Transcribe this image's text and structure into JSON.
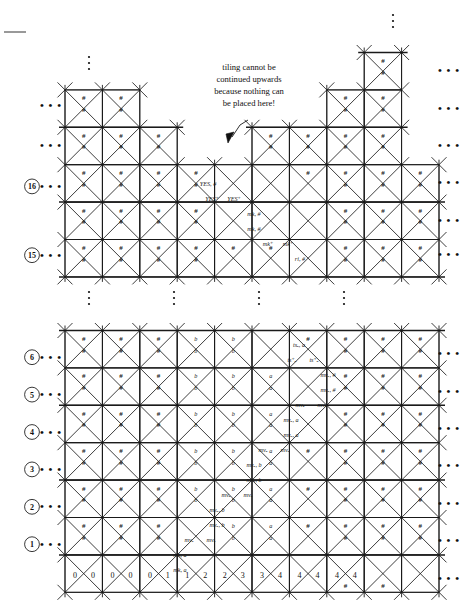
{
  "figure": {
    "annotation": {
      "lines": [
        "tiling cannot be",
        "continued upwards",
        "because nothing can",
        "be placed here!"
      ]
    },
    "ellipsis": "• • •",
    "vertical_dots": "⋮",
    "hash": "#"
  },
  "upper_grid": {
    "row_numbers": [
      "16",
      "15"
    ],
    "labels": [
      {
        "text": "YES, #",
        "x": 208,
        "y": 186
      },
      {
        "text": "YES⁺",
        "x": 212,
        "y": 201
      },
      {
        "text": "YES⁺",
        "x": 234,
        "y": 201
      },
      {
        "text": "mk, #",
        "x": 254,
        "y": 216
      },
      {
        "text": "mk, #",
        "x": 254,
        "y": 231
      },
      {
        "text": "mk⁺",
        "x": 268,
        "y": 246
      },
      {
        "text": "mk⁺",
        "x": 288,
        "y": 246
      },
      {
        "text": "ri, #",
        "x": 300,
        "y": 261
      }
    ]
  },
  "lower_grid": {
    "row_numbers": [
      "6",
      "5",
      "4",
      "3",
      "2",
      "1"
    ],
    "bottom_digits": [
      "0",
      "0",
      "0",
      "0",
      "0",
      "1",
      "1",
      "2",
      "2",
      "3",
      "3",
      "4",
      "4",
      "4",
      "4",
      "4"
    ],
    "letter_cells": {
      "a": "a",
      "b": "b"
    },
    "labels": [
      {
        "text": "tsₐ, a",
        "x": 299,
        "y": 347
      },
      {
        "text": "ts⁺ₐ",
        "x": 292,
        "y": 362
      },
      {
        "text": "ts⁺ₐ",
        "x": 314,
        "y": 362
      },
      {
        "text": "mvₐ, #",
        "x": 328,
        "y": 377
      },
      {
        "text": "mvₐ, #",
        "x": 328,
        "y": 392
      },
      {
        "text": "mvₐ",
        "x": 300,
        "y": 407
      },
      {
        "text": "mvₐ",
        "x": 322,
        "y": 407
      },
      {
        "text": "mvₐ, a",
        "x": 291,
        "y": 422
      },
      {
        "text": "mvₐ, a",
        "x": 291,
        "y": 437
      },
      {
        "text": "mvₐ",
        "x": 263,
        "y": 452
      },
      {
        "text": "mvₐ",
        "x": 285,
        "y": 452
      },
      {
        "text": "mvₐ, b",
        "x": 254,
        "y": 467
      },
      {
        "text": "mvₐ, b",
        "x": 254,
        "y": 482
      },
      {
        "text": "mvₐ",
        "x": 226,
        "y": 497
      },
      {
        "text": "mvₐ",
        "x": 248,
        "y": 497
      },
      {
        "text": "mvₐ, b",
        "x": 217,
        "y": 512
      },
      {
        "text": "mvₐ, b",
        "x": 217,
        "y": 527
      },
      {
        "text": "mvₐ",
        "x": 189,
        "y": 542
      },
      {
        "text": "mvₐ",
        "x": 211,
        "y": 542
      },
      {
        "text": "mk, a",
        "x": 180,
        "y": 557
      },
      {
        "text": "mk, a",
        "x": 180,
        "y": 572
      }
    ]
  }
}
